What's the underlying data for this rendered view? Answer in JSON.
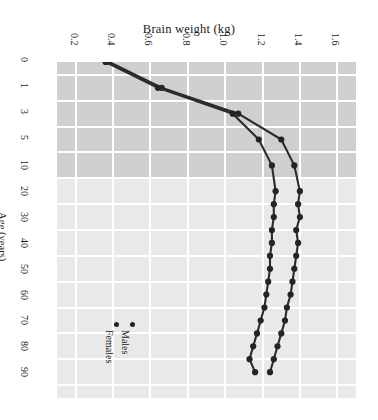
{
  "chart_data": {
    "type": "line",
    "title": "Brain weight (kg)",
    "xlabel": "Brain weight (kg)",
    "ylabel": "Age (years)",
    "orientation": "horizontal-value-vertical-age",
    "xlim": [
      0.1,
      1.7
    ],
    "x_ticks": [
      "0.2",
      "0.4",
      "0.6",
      "0.8",
      "1.0",
      "1.2",
      "1.4",
      "1.6"
    ],
    "x_tick_values": [
      0.2,
      0.4,
      0.6,
      0.8,
      1.0,
      1.2,
      1.4,
      1.6
    ],
    "y_ticks": [
      "0",
      "1",
      "3",
      "5",
      "10",
      "20",
      "30",
      "40",
      "50",
      "60",
      "70",
      "80",
      "90"
    ],
    "y_tick_values": [
      0,
      1,
      3,
      5,
      10,
      20,
      30,
      40,
      50,
      60,
      70,
      80,
      90
    ],
    "y_axis_direction": "downward",
    "y_axis_scale": "ordinal-age-bins",
    "grid": true,
    "grid_color": "#ffffff",
    "shaded_band": {
      "from_age": 0,
      "to_age": 10,
      "color": "#cfcfcf"
    },
    "plot_background": "#e9e9e9",
    "series_color": "#242424",
    "legend_position": "bottom-left",
    "series": [
      {
        "name": "Males",
        "ages": [
          0,
          1,
          3,
          5,
          10,
          20,
          25,
          30,
          35,
          40,
          45,
          50,
          55,
          60,
          65,
          70,
          75,
          80,
          85,
          90
        ],
        "values": [
          0.38,
          0.66,
          1.07,
          1.3,
          1.37,
          1.4,
          1.39,
          1.4,
          1.38,
          1.39,
          1.38,
          1.37,
          1.36,
          1.35,
          1.33,
          1.32,
          1.3,
          1.28,
          1.26,
          1.24
        ]
      },
      {
        "name": "Females",
        "ages": [
          0,
          1,
          3,
          5,
          10,
          20,
          25,
          30,
          35,
          40,
          45,
          50,
          55,
          60,
          65,
          70,
          75,
          80,
          85,
          90
        ],
        "values": [
          0.36,
          0.64,
          1.04,
          1.18,
          1.25,
          1.27,
          1.26,
          1.26,
          1.25,
          1.25,
          1.24,
          1.24,
          1.23,
          1.22,
          1.21,
          1.19,
          1.17,
          1.15,
          1.13,
          1.16
        ]
      }
    ]
  },
  "legend": {
    "items": [
      {
        "label": "Males"
      },
      {
        "label": "Females"
      }
    ]
  }
}
